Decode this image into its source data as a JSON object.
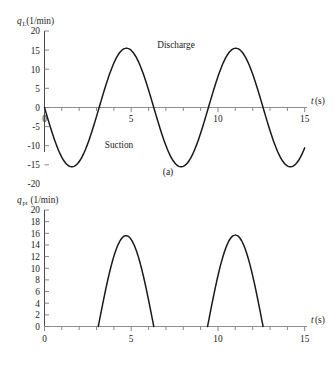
{
  "figure": {
    "panels": [
      {
        "caption": "(a)",
        "ylabel_symbol": "q",
        "ylabel_subscript": "L",
        "ylabel_unit": "(1/min)",
        "xlabel_symbol": "t",
        "xlabel_unit": "(s)",
        "annotations": [
          "Discharge",
          "Suction"
        ]
      },
      {
        "caption": "(b)",
        "ylabel_symbol": "q",
        "ylabel_subscript": "pt",
        "ylabel_unit": "(1/min)",
        "xlabel_symbol": "t",
        "xlabel_unit": "(s)",
        "annotations": []
      }
    ]
  },
  "chart_data": [
    {
      "type": "line",
      "panel": "(a)",
      "title": "",
      "xlabel": "t(s)",
      "ylabel": "qL(1/min)",
      "xlim": [
        0,
        15
      ],
      "ylim": [
        -20,
        20
      ],
      "xticks": [
        0,
        5,
        10,
        15
      ],
      "xticklabels": [
        "0",
        "5",
        "10",
        "15"
      ],
      "xminorticks": [
        1,
        2,
        3,
        4,
        6,
        7,
        8,
        9,
        11,
        12,
        13,
        14
      ],
      "yticks": [
        -20,
        -15,
        -10,
        -5,
        0,
        5,
        10,
        15,
        20
      ],
      "yticklabels": [
        "-20",
        "-15",
        "-10",
        "-5",
        "0",
        "5",
        "10",
        "15",
        "20"
      ],
      "grid": false,
      "legend": "none",
      "annotations": [
        {
          "text": "Discharge",
          "x": 7.6,
          "y": 17.0
        },
        {
          "text": "Suction",
          "x": 4.3,
          "y": -14.5
        }
      ],
      "series": [
        {
          "name": "qL",
          "waveform": "sine",
          "amplitude": 15.5,
          "period": 6.3,
          "phase_deg": 180,
          "offset": 0,
          "description": "Pump piston flow rate: negative half = suction, positive half = discharge",
          "x": [
            0.0,
            0.3,
            0.6,
            0.9,
            1.2,
            1.6,
            1.9,
            2.2,
            2.5,
            2.8,
            3.15,
            3.5,
            3.8,
            4.1,
            4.4,
            4.7,
            5.0,
            5.3,
            5.6,
            5.9,
            6.3,
            6.6,
            6.9,
            7.2,
            7.5,
            7.9,
            8.2,
            8.5,
            8.8,
            9.1,
            9.45,
            9.8,
            10.1,
            10.4,
            10.7,
            11.0,
            11.3,
            11.6,
            11.9,
            12.2,
            12.6,
            12.9,
            13.2,
            13.5,
            13.8,
            14.1,
            14.4,
            14.7,
            15.0
          ],
          "y": [
            0.0,
            -4.6,
            -8.7,
            -12.0,
            -14.2,
            -15.5,
            -15.3,
            -13.8,
            -11.3,
            -7.9,
            0.0,
            4.9,
            8.9,
            12.2,
            14.4,
            15.5,
            15.5,
            14.3,
            11.9,
            8.5,
            0.0,
            -4.4,
            -8.5,
            -11.9,
            -14.2,
            -15.5,
            -15.4,
            -14.0,
            -11.6,
            -8.3,
            0.0,
            4.3,
            8.4,
            11.8,
            14.1,
            15.4,
            15.5,
            14.5,
            12.3,
            9.0,
            0.0,
            -4.1,
            -8.1,
            -11.5,
            -13.9,
            -15.3,
            -14.6,
            -11.8,
            -7.2
          ]
        }
      ]
    },
    {
      "type": "line",
      "panel": "(b)",
      "title": "",
      "xlabel": "t(s)",
      "ylabel": "qpt(1/min)",
      "xlim": [
        0,
        15
      ],
      "ylim": [
        0,
        20
      ],
      "xticks": [
        0,
        5,
        10,
        15
      ],
      "xticklabels": [
        "0",
        "5",
        "10",
        "15"
      ],
      "xminorticks": [
        1,
        2,
        3,
        4,
        6,
        7,
        8,
        9,
        11,
        12,
        13,
        14
      ],
      "yticks": [
        0,
        2,
        4,
        6,
        8,
        10,
        12,
        14,
        16,
        18,
        20
      ],
      "yticklabels": [
        "0",
        "2",
        "4",
        "6",
        "8",
        "10",
        "12",
        "14",
        "16",
        "18",
        "20"
      ],
      "grid": false,
      "legend": "none",
      "annotations": [],
      "series": [
        {
          "name": "qpt",
          "waveform": "half-rectified-sine",
          "amplitude": 15.6,
          "period": 6.3,
          "description": "Pump outlet (discharge-only) flow: positive half-sine pulses, zero elsewhere",
          "pulses": [
            {
              "start": 3.1,
              "peak_x": 4.95,
              "peak_y": 15.6,
              "end": 6.3
            },
            {
              "start": 9.4,
              "peak_x": 11.15,
              "peak_y": 15.7,
              "end": 12.6
            }
          ],
          "x": [
            0.0,
            3.1,
            3.4,
            3.7,
            4.0,
            4.3,
            4.6,
            4.95,
            5.3,
            5.6,
            5.9,
            6.1,
            6.3,
            9.4,
            9.7,
            10.0,
            10.3,
            10.6,
            10.9,
            11.15,
            11.5,
            11.8,
            12.1,
            12.35,
            12.6,
            15.0
          ],
          "y": [
            0.0,
            0.0,
            4.6,
            8.6,
            11.8,
            14.0,
            15.3,
            15.6,
            15.0,
            13.2,
            9.4,
            5.6,
            0.0,
            0.0,
            4.3,
            8.3,
            11.6,
            13.9,
            15.3,
            15.7,
            15.2,
            13.6,
            10.2,
            6.3,
            0.0,
            0.0
          ]
        }
      ]
    }
  ]
}
